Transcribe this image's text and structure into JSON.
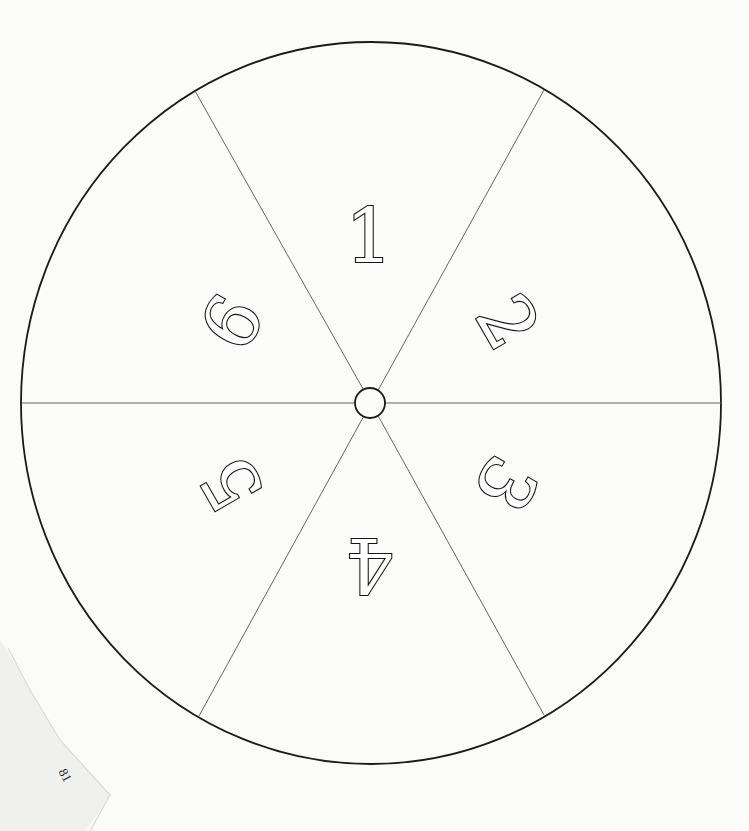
{
  "document": {
    "type": "printed spinner template",
    "page_number": "81"
  },
  "spinner": {
    "sectors": [
      {
        "label": "1",
        "position": "top",
        "rotation_deg": 0
      },
      {
        "label": "2",
        "position": "upper-right",
        "rotation_deg": 60
      },
      {
        "label": "3",
        "position": "lower-right",
        "rotation_deg": 120
      },
      {
        "label": "4",
        "position": "bottom",
        "rotation_deg": 180
      },
      {
        "label": "5",
        "position": "lower-left",
        "rotation_deg": 240
      },
      {
        "label": "6",
        "position": "upper-left",
        "rotation_deg": 300
      }
    ],
    "sector_count": 6,
    "center_hub": "small circle at center"
  },
  "colors": {
    "paper": "#fbfbfa",
    "ink": "#151515",
    "spoke": "#555555"
  }
}
